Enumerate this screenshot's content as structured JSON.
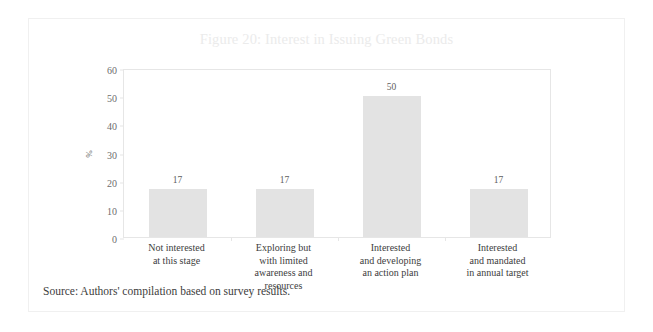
{
  "figure": {
    "title": "Figure 20: Interest in Issuing Green Bonds",
    "source_note": "Source: Authors' compilation based on survey results."
  },
  "chart_data": {
    "type": "bar",
    "title": "Figure 20: Interest in Issuing Green Bonds",
    "xlabel": "",
    "ylabel": "%",
    "ylim": [
      0,
      60
    ],
    "yticks": [
      0,
      10,
      20,
      30,
      40,
      50,
      60
    ],
    "grid": false,
    "legend": null,
    "bar_color": "#e3e3e3",
    "categories": [
      "Not interested\nat this stage",
      "Exploring but\nwith limited\nawareness and\nresources",
      "Interested\nand developing\nan action plan",
      "Interested\nand mandated\nin annual target"
    ],
    "category_lines": [
      [
        "Not interested",
        "at this stage"
      ],
      [
        "Exploring but",
        "with limited",
        "awareness and",
        "resources"
      ],
      [
        "Interested",
        "and developing",
        "an action plan"
      ],
      [
        "Interested",
        "and mandated",
        "in annual target"
      ]
    ],
    "values": [
      17,
      17,
      50,
      17
    ],
    "data_labels": [
      "17",
      "17",
      "50",
      "17"
    ],
    "ytick_labels": [
      "0",
      "10",
      "20",
      "30",
      "40",
      "50",
      "60"
    ]
  }
}
